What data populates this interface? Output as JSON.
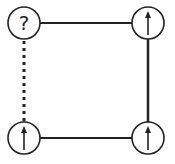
{
  "diagram": {
    "stroke_color": "#222222",
    "background": "#ffffff",
    "nodes": [
      {
        "id": "top-left",
        "cx": 24,
        "cy": 23,
        "r": 16,
        "content": "?",
        "type": "unknown"
      },
      {
        "id": "top-right",
        "cx": 148,
        "cy": 23,
        "r": 16,
        "content": "up-arrow",
        "type": "arrow"
      },
      {
        "id": "bottom-left",
        "cx": 24,
        "cy": 138,
        "r": 16,
        "content": "up-arrow",
        "type": "arrow"
      },
      {
        "id": "bottom-right",
        "cx": 148,
        "cy": 138,
        "r": 16,
        "content": "up-arrow",
        "type": "arrow"
      }
    ],
    "edges": [
      {
        "from": "top-left",
        "to": "top-right",
        "style": "solid"
      },
      {
        "from": "top-right",
        "to": "bottom-right",
        "style": "solid"
      },
      {
        "from": "bottom-left",
        "to": "bottom-right",
        "style": "solid"
      },
      {
        "from": "top-left",
        "to": "bottom-left",
        "style": "dotted"
      }
    ],
    "unknown_label": "?"
  }
}
